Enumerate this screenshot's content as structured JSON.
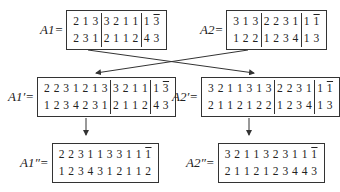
{
  "matrices": {
    "A1": {
      "label": "A1=",
      "rows": [
        [
          "213",
          "3211",
          "13"
        ],
        [
          "231",
          "2112",
          "43"
        ]
      ],
      "overline_last_in_row1": true
    },
    "A2": {
      "label": "A2=",
      "rows": [
        [
          "313",
          "2231",
          "11"
        ],
        [
          "122",
          "1234",
          "13"
        ]
      ],
      "overline_last_in_row1": true
    },
    "A1p": {
      "label": "A1′=",
      "rows": [
        [
          "2231213",
          "3211",
          "13"
        ],
        [
          "1234231",
          "2112",
          "43"
        ]
      ],
      "overline_last_in_row1": true
    },
    "A2p": {
      "label": "A2′=",
      "rows": [
        [
          "3211313",
          "2231",
          "11"
        ],
        [
          "2112122",
          "1234",
          "13"
        ]
      ],
      "overline_last_in_row1": true
    },
    "A1pp": {
      "label": "A1″=",
      "rows": [
        [
          "2231133111"
        ],
        [
          "1234312112"
        ]
      ],
      "overline_last_in_row1": true
    },
    "A2pp": {
      "label": "A2″=",
      "rows": [
        [
          "3211323111"
        ],
        [
          "2112123443"
        ]
      ],
      "overline_last_in_row1": true
    }
  },
  "arrows": [
    {
      "from": "A1",
      "to": "A2p",
      "type": "crossing"
    },
    {
      "from": "A2",
      "to": "A1p",
      "type": "crossing"
    },
    {
      "from": "A1p",
      "to": "A1pp",
      "type": "vertical"
    },
    {
      "from": "A2p",
      "to": "A2pp",
      "type": "vertical"
    }
  ]
}
